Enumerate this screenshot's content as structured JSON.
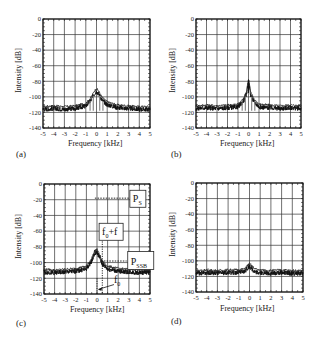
{
  "figure": {
    "panels": [
      {
        "id": "a",
        "label": "(a)"
      },
      {
        "id": "b",
        "label": "(b)"
      },
      {
        "id": "c",
        "label": "(c)"
      },
      {
        "id": "d",
        "label": "(d)"
      }
    ],
    "xlabel": "Frequency [kHz]",
    "ylabel": "Intensity [dB]",
    "annotations_c": {
      "ps": "P",
      "ps_sub": "S",
      "f0f": "f",
      "f0f_sub": "0",
      "f0f_tail": "+f",
      "pssb": "P",
      "pssb_sub": "SSB",
      "f0": "f",
      "f0_sub": "0"
    }
  },
  "chart_data": [
    {
      "type": "line",
      "panel": "(a)",
      "title": "",
      "xlabel": "Frequency [kHz]",
      "ylabel": "Intensity [dB]",
      "xlim": [
        -5,
        5
      ],
      "ylim": [
        -140,
        0
      ],
      "xticks": [
        -5,
        -4,
        -3,
        -2,
        -1,
        0,
        1,
        2,
        3,
        4,
        5
      ],
      "yticks": [
        0,
        -20,
        -40,
        -60,
        -80,
        -100,
        -120,
        -140
      ],
      "grid": true,
      "series": [
        {
          "name": "spectrum",
          "x": [
            -5,
            -4,
            -3,
            -2,
            -1,
            -0.5,
            -0.2,
            0,
            0.2,
            0.5,
            1,
            2,
            3,
            4,
            5
          ],
          "values": [
            -116,
            -115,
            -116,
            -115,
            -112,
            -104,
            -96,
            -93,
            -96,
            -104,
            -110,
            -114,
            -115,
            -116,
            -116
          ]
        }
      ]
    },
    {
      "type": "line",
      "panel": "(b)",
      "title": "",
      "xlabel": "Frequency [kHz]",
      "ylabel": "Intensity [dB]",
      "xlim": [
        -5,
        5
      ],
      "ylim": [
        -140,
        0
      ],
      "xticks": [
        -5,
        -4,
        -3,
        -2,
        -1,
        0,
        1,
        2,
        3,
        4,
        5
      ],
      "yticks": [
        0,
        -20,
        -40,
        -60,
        -80,
        -100,
        -120,
        -140
      ],
      "grid": true,
      "series": [
        {
          "name": "spectrum",
          "x": [
            -5,
            -4,
            -3,
            -2,
            -1,
            -0.5,
            -0.2,
            0,
            0.2,
            0.5,
            1,
            2,
            3,
            4,
            5
          ],
          "values": [
            -115,
            -114,
            -115,
            -114,
            -113,
            -106,
            -97,
            -80,
            -97,
            -106,
            -113,
            -114,
            -115,
            -114,
            -115
          ]
        }
      ]
    },
    {
      "type": "line",
      "panel": "(c)",
      "title": "",
      "xlabel": "Frequency [kHz]",
      "ylabel": "Intensity [dB]",
      "xlim": [
        -5,
        5
      ],
      "ylim": [
        -140,
        0
      ],
      "xticks": [
        -5,
        -4,
        -3,
        -2,
        -1,
        0,
        1,
        2,
        3,
        4,
        5
      ],
      "yticks": [
        0,
        -20,
        -40,
        -60,
        -80,
        -100,
        -120,
        -140
      ],
      "grid": true,
      "annotations": [
        {
          "text": "P_S",
          "y": -18
        },
        {
          "text": "f_0+f",
          "x": 0.5
        },
        {
          "text": "P_SSB",
          "y": -98
        },
        {
          "text": "f_0",
          "x": 0
        }
      ],
      "series": [
        {
          "name": "spectrum",
          "x": [
            -5,
            -4,
            -3,
            -2,
            -1,
            -0.5,
            -0.2,
            0,
            0.2,
            0.5,
            1,
            2,
            3,
            4,
            5
          ],
          "values": [
            -112,
            -113,
            -112,
            -111,
            -108,
            -98,
            -88,
            -87,
            -92,
            -102,
            -108,
            -111,
            -112,
            -113,
            -112
          ]
        }
      ]
    },
    {
      "type": "line",
      "panel": "(d)",
      "title": "",
      "xlabel": "Frequency [kHz]",
      "ylabel": "Intensity [dB]",
      "xlim": [
        -5,
        5
      ],
      "ylim": [
        -140,
        0
      ],
      "xticks": [
        -5,
        -4,
        -3,
        -2,
        -1,
        0,
        1,
        2,
        3,
        4,
        5
      ],
      "yticks": [
        0,
        -20,
        -40,
        -60,
        -80,
        -100,
        -120,
        -140
      ],
      "grid": true,
      "series": [
        {
          "name": "spectrum",
          "x": [
            -5,
            -4,
            -3,
            -2,
            -1,
            -0.5,
            0,
            0.5,
            1,
            2,
            3,
            4,
            5
          ],
          "values": [
            -116,
            -115,
            -116,
            -115,
            -115,
            -114,
            -107,
            -114,
            -115,
            -116,
            -115,
            -116,
            -116
          ]
        }
      ]
    }
  ]
}
